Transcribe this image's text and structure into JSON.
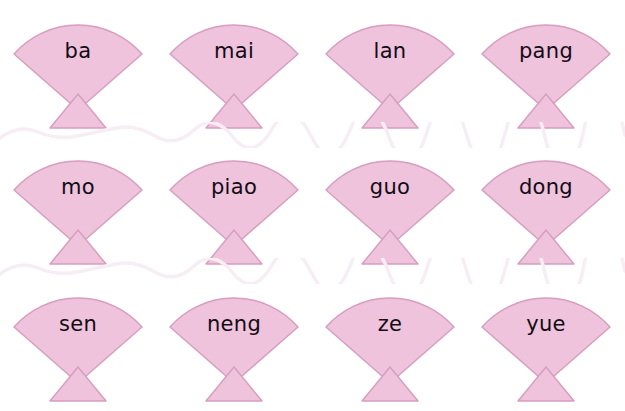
{
  "page": {
    "background_color": "#ffffff",
    "shape_name": "fan-bowtie"
  },
  "theme": {
    "fan_fill": "#eec3db",
    "fan_stroke": "#d79dc0",
    "text_color": "#120c14",
    "wave_color": "#f6eef4"
  },
  "rows": [
    {
      "id": "row-1",
      "cards": [
        {
          "label": "ba"
        },
        {
          "label": "mai"
        },
        {
          "label": "lan"
        },
        {
          "label": "pang"
        }
      ]
    },
    {
      "id": "row-2",
      "cards": [
        {
          "label": "mo"
        },
        {
          "label": "piao"
        },
        {
          "label": "guo"
        },
        {
          "label": "dong"
        }
      ]
    },
    {
      "id": "row-3",
      "cards": [
        {
          "label": "sen"
        },
        {
          "label": "neng"
        },
        {
          "label": "ze"
        },
        {
          "label": "yue"
        }
      ]
    }
  ],
  "dividers": [
    {
      "id": "wave-1",
      "style": "wavy-line"
    },
    {
      "id": "wave-2",
      "style": "wavy-line"
    }
  ]
}
